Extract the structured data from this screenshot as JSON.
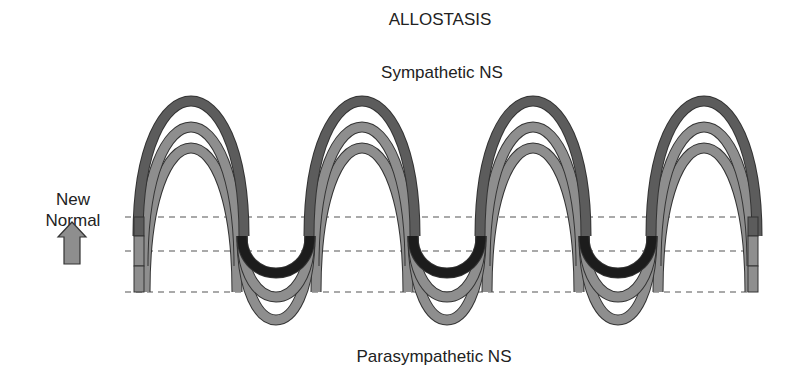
{
  "title": "ALLOSTASIS",
  "top_label": "Sympathetic NS",
  "bottom_label": "Parasympathetic NS",
  "side_label": {
    "line1": "New",
    "line2": "Normal",
    "arrow": "up-arrow-icon"
  },
  "diagram": {
    "cycles": 4,
    "levels": [
      {
        "name": "baseline-low",
        "role": "original normal"
      },
      {
        "name": "baseline-mid",
        "role": "intermediate"
      },
      {
        "name": "baseline-high",
        "role": "new normal"
      }
    ],
    "colors": {
      "peak_outer": "#5c5c5c",
      "arc_medium": "#8e8e8e",
      "trough_inner": "#1c1c1c",
      "outline": "#333333",
      "arrow_fill": "#8e8e8e",
      "dash": "#555555"
    }
  }
}
